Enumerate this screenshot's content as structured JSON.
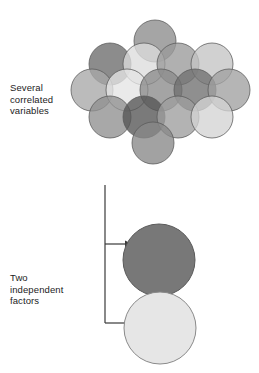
{
  "page": {
    "width": 259,
    "height": 373,
    "background": "#ffffff",
    "kind": "diagram"
  },
  "labels": {
    "correlated": "Several\ncorrelated\nvariables",
    "factors": "Two\nindependent\nfactors"
  },
  "chart_data": {
    "type": "diagram",
    "title": "",
    "stroke": "#5a5a5a",
    "arrow_color": "#3a3a3a",
    "cluster": {
      "name": "correlated-variables-cluster",
      "radius": 21,
      "opacity": 0.78,
      "circles": [
        {
          "id": "c1",
          "cx": 95,
          "cy": 31,
          "fill": "#8c8c8c"
        },
        {
          "id": "c2",
          "cx": 50,
          "cy": 54,
          "fill": "#6b6b6b"
        },
        {
          "id": "c3",
          "cx": 84,
          "cy": 54,
          "fill": "#dcdcdc"
        },
        {
          "id": "c4",
          "cx": 118,
          "cy": 54,
          "fill": "#9a9a9a"
        },
        {
          "id": "c5",
          "cx": 152,
          "cy": 54,
          "fill": "#c4c4c4"
        },
        {
          "id": "c6",
          "cx": 32,
          "cy": 80,
          "fill": "#a8a8a8"
        },
        {
          "id": "c7",
          "cx": 67,
          "cy": 80,
          "fill": "#e4e4e4"
        },
        {
          "id": "c8",
          "cx": 101,
          "cy": 80,
          "fill": "#8a8a8a"
        },
        {
          "id": "c9",
          "cx": 135,
          "cy": 80,
          "fill": "#6f6f6f"
        },
        {
          "id": "c10",
          "cx": 169,
          "cy": 80,
          "fill": "#a0a0a0"
        },
        {
          "id": "c11",
          "cx": 50,
          "cy": 107,
          "fill": "#8f8f8f"
        },
        {
          "id": "c12",
          "cx": 84,
          "cy": 107,
          "fill": "#555555"
        },
        {
          "id": "c13",
          "cx": 118,
          "cy": 107,
          "fill": "#9d9d9d"
        },
        {
          "id": "c14",
          "cx": 152,
          "cy": 107,
          "fill": "#d3d3d3"
        },
        {
          "id": "c15",
          "cx": 93,
          "cy": 133,
          "fill": "#888888"
        }
      ]
    },
    "factors": [
      {
        "id": "f1",
        "name": "factor-one-circle",
        "cx": 47,
        "cy": 44,
        "r": 36,
        "fill": "#787878",
        "stroke": "#5a5a5a"
      },
      {
        "id": "f2",
        "name": "factor-two-circle",
        "cx": 48,
        "cy": 112,
        "r": 36,
        "fill": "#e6e6e6",
        "stroke": "#8a8a8a"
      }
    ],
    "connector": {
      "name": "factor-connector",
      "x": 9,
      "top": 5,
      "bottom": 143,
      "arrows": [
        {
          "y": 64,
          "x_end": 36
        },
        {
          "y": 143,
          "x_end": 36
        }
      ]
    }
  }
}
